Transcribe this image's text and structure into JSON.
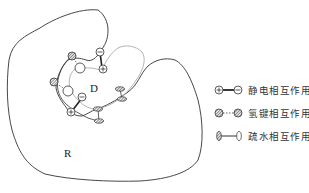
{
  "diagram": {
    "receptor_label": "R",
    "drug_label": "D",
    "colors": {
      "receptor_outline": "#333333",
      "drug_outline": "#aaaaaa",
      "bond": "#222222",
      "background": "#ffffff"
    }
  },
  "legend": {
    "items": [
      {
        "icon": "electrostatic-icon",
        "label": "静电相互作用"
      },
      {
        "icon": "hydrogen-bond-icon",
        "label": "氢键相互作用"
      },
      {
        "icon": "hydrophobic-icon",
        "label": "疏水相互作用"
      }
    ]
  }
}
